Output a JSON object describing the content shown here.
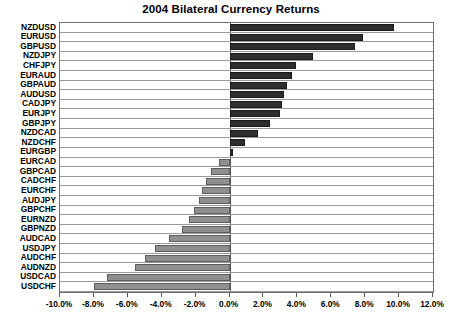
{
  "chart_data": {
    "type": "bar",
    "orientation": "horizontal",
    "title": "2004 Bilateral Currency Returns",
    "xlabel": "",
    "ylabel": "",
    "xlim": [
      -10.0,
      12.0
    ],
    "xtick_values": [
      -10.0,
      -8.0,
      -6.0,
      -4.0,
      -2.0,
      0.0,
      2.0,
      4.0,
      6.0,
      8.0,
      10.0,
      12.0
    ],
    "xtick_labels": [
      "-10.0%",
      "-8.0%",
      "-6.0%",
      "-4.0%",
      "-2.0%",
      "0.0%",
      "2.0%",
      "4.0%",
      "6.0%",
      "8.0%",
      "10.0%",
      "12.0%"
    ],
    "grid": true,
    "grid_axis": "y",
    "legend": false,
    "value_unit": "percent",
    "categories": [
      "NZDUSD",
      "EURUSD",
      "GBPUSD",
      "NZDJPY",
      "CHFJPY",
      "EURAUD",
      "GBPAUD",
      "AUDUSD",
      "CADJPY",
      "EURJPY",
      "GBPJPY",
      "NZDCAD",
      "NZDCHF",
      "EURGBP",
      "EURCAD",
      "GBPCAD",
      "CADCHF",
      "EURCHF",
      "AUDJPY",
      "GBPCHF",
      "EURNZD",
      "GBPNZD",
      "AUDCAD",
      "USDJPY",
      "AUDCHF",
      "AUDNZD",
      "USDCAD",
      "USDCHF"
    ],
    "values": [
      9.7,
      7.9,
      7.4,
      4.9,
      3.9,
      3.7,
      3.4,
      3.2,
      3.1,
      3.0,
      2.4,
      1.7,
      0.9,
      0.2,
      -0.6,
      -1.1,
      -1.4,
      -1.6,
      -1.8,
      -2.1,
      -2.4,
      -2.8,
      -3.6,
      -4.4,
      -5.0,
      -5.6,
      -7.2,
      -8.0
    ],
    "series": [
      {
        "name": "2004 return",
        "positive_color": "#2e2e2e",
        "negative_color": "#8f8f8f",
        "values": [
          9.7,
          7.9,
          7.4,
          4.9,
          3.9,
          3.7,
          3.4,
          3.2,
          3.1,
          3.0,
          2.4,
          1.7,
          0.9,
          0.2,
          -0.6,
          -1.1,
          -1.4,
          -1.6,
          -1.8,
          -2.1,
          -2.4,
          -2.8,
          -3.6,
          -4.4,
          -5.0,
          -5.6,
          -7.2,
          -8.0
        ]
      }
    ],
    "colors": {
      "positive_bar": "#2e2e2e",
      "negative_bar": "#8f8f8f",
      "gridline": "#9a9a9a",
      "axis": "#5a5a5a",
      "background": "#ffffff",
      "text": "#000000"
    }
  }
}
